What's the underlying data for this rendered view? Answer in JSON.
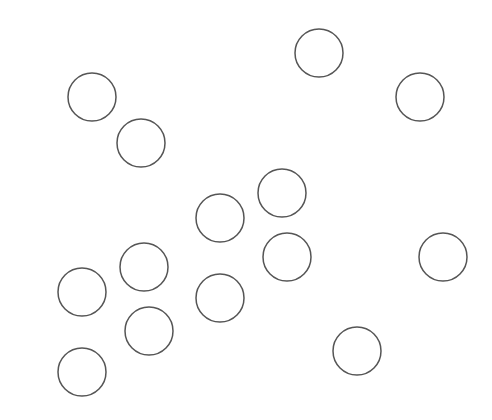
{
  "canvas": {
    "width": 492,
    "height": 420,
    "background": "#ffffff"
  },
  "style": {
    "stroke": "#555555",
    "stroke_width": 1.5,
    "fill": "none"
  },
  "circles": [
    {
      "cx": 319,
      "cy": 53,
      "r": 24
    },
    {
      "cx": 92,
      "cy": 97,
      "r": 24
    },
    {
      "cx": 420,
      "cy": 97,
      "r": 24
    },
    {
      "cx": 141,
      "cy": 143,
      "r": 24
    },
    {
      "cx": 282,
      "cy": 193,
      "r": 24
    },
    {
      "cx": 220,
      "cy": 218,
      "r": 24
    },
    {
      "cx": 287,
      "cy": 257,
      "r": 24
    },
    {
      "cx": 443,
      "cy": 257,
      "r": 24
    },
    {
      "cx": 144,
      "cy": 267,
      "r": 24
    },
    {
      "cx": 82,
      "cy": 292,
      "r": 24
    },
    {
      "cx": 220,
      "cy": 298,
      "r": 24
    },
    {
      "cx": 149,
      "cy": 331,
      "r": 24
    },
    {
      "cx": 357,
      "cy": 351,
      "r": 24
    },
    {
      "cx": 82,
      "cy": 372,
      "r": 24
    }
  ]
}
